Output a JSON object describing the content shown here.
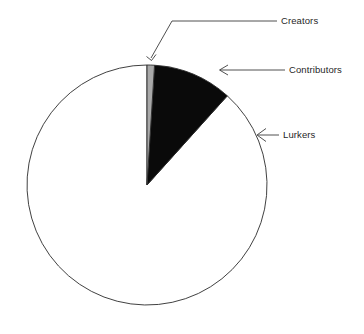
{
  "chart_data": {
    "type": "pie",
    "title": "",
    "subtitle": "",
    "xlabel": "",
    "ylabel": "",
    "grid": false,
    "legend_position": "callout-labels-right",
    "start_angle_deg": 0,
    "direction": "clockwise",
    "categories": [
      "Creators",
      "Contributors",
      "Lurkers"
    ],
    "values": [
      1,
      9,
      90
    ],
    "unit": "percent",
    "slices": [
      {
        "label": "Creators",
        "value": 1,
        "percent": 1,
        "color": "#a9a9a9",
        "start_angle_deg": 0,
        "end_angle_deg": 3.6
      },
      {
        "label": "Contributors",
        "value": 9,
        "percent": 9,
        "color": "#0a0a0a",
        "start_angle_deg": 3.6,
        "end_angle_deg": 42.0
      },
      {
        "label": "Lurkers",
        "value": 90,
        "percent": 90,
        "color": "#ffffff",
        "start_angle_deg": 42.0,
        "end_angle_deg": 360.0
      }
    ],
    "annotations": [
      {
        "label": "Creators",
        "target": "creators-slice"
      },
      {
        "label": "Contributors",
        "target": "contributors-slice"
      },
      {
        "label": "Lurkers",
        "target": "lurkers-slice"
      }
    ]
  },
  "labels": {
    "creators": "Creators",
    "contributors": "Contributors",
    "lurkers": "Lurkers"
  },
  "geometry": {
    "center_x": 147,
    "center_y": 185,
    "radius": 120
  },
  "colors": {
    "creators": "#a9a9a9",
    "contributors": "#0a0a0a",
    "lurkers": "#ffffff",
    "outline": "#2b2b2b",
    "leader": "#3c3c3c",
    "text": "#1f1f1f",
    "background": "#ffffff"
  }
}
